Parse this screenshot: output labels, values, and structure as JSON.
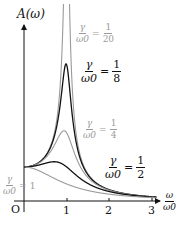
{
  "chart_data": {
    "type": "line",
    "title": "",
    "xlabel": "ω/ω0",
    "ylabel": "A(ω)",
    "xlim": [
      0,
      3.1
    ],
    "ylim": [
      0,
      5.5
    ],
    "grid": false,
    "x_ticks": [
      "O",
      "1",
      "2",
      "3"
    ],
    "formula": "A(x) = 1 / sqrt((1 - x^2)^2 + (2*r*x)^2), x = ω/ω0, r = γ/ω0",
    "series": [
      {
        "name": "γ/ω0 = 1/20",
        "ratio": 0.05,
        "color": "#9a9a9a",
        "peak_A": 10.0,
        "peak_x": 1.0,
        "note": "clipped at top"
      },
      {
        "name": "γ/ω0 = 1/8",
        "ratio": 0.125,
        "color": "#111111",
        "peak_A": 4.03,
        "peak_x": 0.98
      },
      {
        "name": "γ/ω0 = 1/4",
        "ratio": 0.25,
        "color": "#9a9a9a",
        "peak_A": 2.07,
        "peak_x": 0.94
      },
      {
        "name": "γ/ω0 = 1/2",
        "ratio": 0.5,
        "color": "#111111",
        "peak_A": 1.15,
        "peak_x": 0.71
      },
      {
        "name": "γ/ω0 = 1",
        "ratio": 1.0,
        "color": "#9a9a9a",
        "peak_A": 1.0,
        "peak_x": 0.0
      }
    ],
    "annotations": [
      {
        "text": "γ/ω0 = 1/20",
        "color": "#9a9a9a"
      },
      {
        "text": "γ/ω0 = 1/8",
        "color": "#111111"
      },
      {
        "text": "γ/ω0 = 1/4",
        "color": "#9a9a9a"
      },
      {
        "text": "γ/ω0 = 1/2",
        "color": "#111111"
      },
      {
        "text": "γ/ω0 = 1",
        "color": "#9a9a9a"
      }
    ]
  },
  "axis": {
    "y_label": "A(ω)",
    "x_label_num": "ω",
    "x_label_den": "ω0",
    "origin": "O",
    "ticks": [
      "1",
      "2",
      "3"
    ]
  },
  "labels": [
    {
      "num": "γ",
      "den": "ω0",
      "eq": "=",
      "rnum": "1",
      "rden": "20",
      "color": "#9a9a9a"
    },
    {
      "num": "γ",
      "den": "ω0",
      "eq": "=",
      "rnum": "1",
      "rden": "8",
      "color": "#111111"
    },
    {
      "num": "γ",
      "den": "ω0",
      "eq": "=",
      "rnum": "1",
      "rden": "4",
      "color": "#9a9a9a"
    },
    {
      "num": "γ",
      "den": "ω0",
      "eq": "=",
      "rnum": "1",
      "rden": "2",
      "color": "#111111"
    },
    {
      "num": "γ",
      "den": "ω0",
      "eq": "=",
      "rval": "1",
      "color": "#9a9a9a"
    }
  ]
}
